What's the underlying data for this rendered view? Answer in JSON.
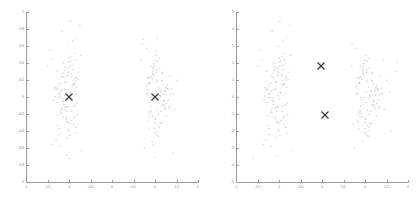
{
  "figure": {
    "background": "#ffffff",
    "point_color": "#a8a8a8",
    "axis_color": "#9a9a9a",
    "centroid_color": "#3a3a3a"
  },
  "chart_data": [
    {
      "type": "scatter",
      "title": "",
      "xlabel": "",
      "ylabel": "",
      "xlim": [
        -2,
        2
      ],
      "ylim": [
        -1,
        1
      ],
      "grid": false,
      "legend": null,
      "xticks": [
        -2,
        -1.5,
        -1,
        -0.5,
        0,
        0.5,
        1,
        1.5,
        2
      ],
      "xticklabels": [
        "-2",
        "-1.5",
        "-1",
        "-0.5",
        "0",
        "0.5",
        "1",
        "1.5",
        "2"
      ],
      "yticks": [
        -1,
        -0.8,
        -0.6,
        -0.4,
        -0.2,
        0,
        0.2,
        0.4,
        0.6,
        0.8,
        1
      ],
      "yticklabels": [
        "-1",
        "-0.8",
        "-0.6",
        "-0.4",
        "-0.2",
        "0",
        "0.2",
        "0.4",
        "0.6",
        "0.8",
        "1"
      ],
      "series": [
        {
          "name": "cluster-a-points",
          "marker": "+",
          "x": [
            -1.02,
            -0.93,
            -1.12,
            -0.86,
            -1.21,
            -0.97,
            -1.05,
            -0.78,
            -1.3,
            -0.9,
            -1.08,
            -1.15,
            -0.82,
            -1.0,
            -1.25,
            -0.95,
            -1.18,
            -0.88,
            -1.07,
            -0.99,
            -1.1,
            -0.84,
            -1.22,
            -1.03,
            -0.91,
            -1.14,
            -0.8,
            -1.28,
            -0.96,
            -1.06,
            -1.19,
            -0.87,
            -1.01,
            -1.24,
            -0.94,
            -1.11,
            -0.83,
            -1.33,
            -0.98,
            -1.09,
            -1.16,
            -0.89,
            -1.04,
            -1.26,
            -0.92,
            -1.13,
            -0.81,
            -1.31,
            -1.0,
            -1.17,
            -0.85,
            -1.23,
            -1.02,
            -0.93,
            -1.2,
            -0.79,
            -1.35,
            -1.08,
            -0.97,
            -1.12,
            -1.27,
            -0.9,
            -1.05,
            -1.14,
            -0.86,
            -1.29,
            -1.01,
            -0.95,
            -1.1,
            -1.21,
            -0.88,
            -1.06,
            -1.17,
            -0.82,
            -1.32,
            -0.99,
            -1.03,
            -1.15,
            -0.91,
            -1.24,
            -1.07,
            -0.94,
            -1.13,
            -0.84,
            -1.26,
            -1.0,
            -1.09,
            -1.18,
            -0.89,
            -1.22,
            -1.04,
            -0.96,
            -1.11,
            -0.87,
            -1.3,
            -1.02,
            -0.92,
            -1.16,
            -1.2,
            -0.85,
            -1.45,
            -0.7,
            -1.4,
            -0.75,
            -1.38,
            -0.72,
            -1.5,
            -1.05,
            -0.98,
            -1.01
          ],
          "y": [
            0.02,
            0.15,
            -0.08,
            0.22,
            -0.18,
            0.05,
            -0.12,
            0.3,
            0.08,
            -0.25,
            0.18,
            -0.05,
            0.12,
            -0.3,
            0.0,
            0.25,
            -0.15,
            -0.22,
            0.1,
            -0.02,
            0.35,
            -0.35,
            0.04,
            -0.1,
            0.2,
            0.28,
            -0.2,
            -0.06,
            0.42,
            -0.28,
            0.07,
            0.16,
            -0.4,
            0.13,
            -0.16,
            0.32,
            0.24,
            0.01,
            -0.45,
            0.19,
            -0.13,
            -0.32,
            0.26,
            0.09,
            0.38,
            -0.24,
            -0.07,
            0.11,
            0.46,
            -0.19,
            0.03,
            -0.36,
            0.29,
            -0.11,
            0.17,
            0.21,
            -0.03,
            -0.26,
            0.06,
            0.4,
            -0.21,
            0.14,
            -0.48,
            0.23,
            -0.09,
            0.31,
            -0.38,
            0.27,
            -0.14,
            0.0,
            0.44,
            -0.17,
            0.08,
            -0.42,
            0.12,
            0.36,
            -0.29,
            -0.01,
            0.33,
            0.05,
            -0.23,
            0.48,
            -0.04,
            0.2,
            -0.33,
            0.41,
            -0.12,
            0.25,
            0.15,
            -0.44,
            0.34,
            -0.27,
            0.1,
            0.52,
            -0.5,
            0.6,
            0.66,
            0.78,
            -0.58,
            0.7,
            0.55,
            -0.62,
            0.45,
            0.85,
            -0.55,
            0.5,
            0.37,
            -0.68,
            0.9,
            -0.72
          ]
        },
        {
          "name": "cluster-b-points",
          "marker": "+",
          "x": [
            0.98,
            1.08,
            0.9,
            1.15,
            0.85,
            1.02,
            1.2,
            0.94,
            1.12,
            0.8,
            1.05,
            0.88,
            1.25,
            1.0,
            0.96,
            1.18,
            0.83,
            1.1,
            1.03,
            0.92,
            1.14,
            0.86,
            1.22,
            0.99,
            1.07,
            0.81,
            1.28,
            0.95,
            1.16,
            1.01,
            0.89,
            1.24,
            0.93,
            1.11,
            0.84,
            1.3,
            0.97,
            1.06,
            1.19,
            0.87,
            1.04,
            1.26,
            0.91,
            1.13,
            0.82,
            1.32,
            1.0,
            1.17,
            0.85,
            1.23,
            1.02,
            0.94,
            1.09,
            0.79,
            1.35,
            1.08,
            0.98,
            1.21,
            0.9,
            1.05,
            1.15,
            0.86,
            1.29,
            1.01,
            0.96,
            1.1,
            1.27,
            0.88,
            1.06,
            1.18,
            0.83,
            1.33,
            0.99,
            1.03,
            1.14,
            0.92,
            1.25,
            1.07,
            0.95,
            1.12,
            0.84,
            1.31,
            1.0,
            1.09,
            1.2,
            0.89,
            1.22,
            1.04,
            0.97,
            1.16,
            0.87,
            1.34,
            1.02,
            0.93,
            1.17,
            1.26,
            0.8,
            1.38,
            0.75,
            1.45,
            0.7,
            1.4,
            1.5,
            0.72,
            1.42,
            0.68,
            1.05,
            0.99,
            1.01,
            0.96
          ],
          "y": [
            0.0,
            0.12,
            -0.1,
            0.2,
            -0.2,
            0.06,
            -0.05,
            0.28,
            -0.3,
            0.15,
            -0.15,
            0.24,
            0.03,
            -0.25,
            0.33,
            -0.08,
            0.1,
            -0.35,
            0.18,
            -0.02,
            0.08,
            -0.18,
            -0.12,
            0.26,
            -0.4,
            0.04,
            0.14,
            -0.22,
            0.3,
            -0.06,
            0.36,
            -0.14,
            0.21,
            0.02,
            -0.28,
            0.09,
            0.4,
            -0.33,
            -0.04,
            0.16,
            -0.45,
            0.11,
            0.23,
            -0.16,
            0.05,
            -0.11,
            0.44,
            0.19,
            -0.38,
            0.07,
            -0.26,
            0.31,
            -0.01,
            0.13,
            0.25,
            -0.2,
            0.38,
            -0.09,
            0.0,
            0.2,
            -0.31,
            0.17,
            0.1,
            -0.42,
            0.27,
            0.34,
            -0.07,
            -0.24,
            0.42,
            0.03,
            0.22,
            -0.13,
            -0.36,
            0.29,
            0.06,
            -0.19,
            0.12,
            -0.46,
            0.35,
            0.01,
            0.24,
            -0.03,
            -0.29,
            0.46,
            0.15,
            -0.17,
            0.08,
            0.32,
            -0.41,
            -0.09,
            0.18,
            0.04,
            0.5,
            -0.52,
            0.28,
            -0.22,
            0.58,
            0.11,
            -0.6,
            -0.14,
            0.62,
            0.05,
            0.2,
            0.68,
            -0.66,
            0.44,
            0.7,
            -0.7,
            0.54,
            -0.57
          ]
        }
      ],
      "centroids": [
        {
          "name": "centroid-a",
          "x": -1.0,
          "y": 0.0,
          "marker": "X"
        },
        {
          "name": "centroid-b",
          "x": 1.0,
          "y": 0.0,
          "marker": "X"
        }
      ]
    },
    {
      "type": "scatter",
      "title": "",
      "xlabel": "",
      "ylabel": "",
      "xlim": [
        -2,
        2
      ],
      "ylim": [
        -5,
        5
      ],
      "grid": false,
      "legend": null,
      "xticks": [
        -2,
        -1.5,
        -1,
        -0.5,
        0,
        0.5,
        1,
        1.5,
        2
      ],
      "xticklabels": [
        "-2",
        "-1.5",
        "-1",
        "-0.5",
        "0",
        "0.5",
        "1",
        "1.5",
        "2"
      ],
      "yticks": [
        -5,
        -4,
        -3,
        -2,
        -1,
        0,
        1,
        2,
        3,
        4,
        5
      ],
      "yticklabels": [
        "-5",
        "-4",
        "-3",
        "-2",
        "-1",
        "0",
        "1",
        "2",
        "3",
        "4",
        "5"
      ],
      "series": [
        {
          "name": "cluster-a-points",
          "marker": "+",
          "x": [
            -1.02,
            -0.93,
            -1.12,
            -0.86,
            -1.21,
            -0.97,
            -1.05,
            -0.78,
            -1.3,
            -0.9,
            -1.08,
            -1.15,
            -0.82,
            -1.0,
            -1.25,
            -0.95,
            -1.18,
            -0.88,
            -1.07,
            -0.99,
            -1.1,
            -0.84,
            -1.22,
            -1.03,
            -0.91,
            -1.14,
            -0.8,
            -1.28,
            -0.96,
            -1.06,
            -1.19,
            -0.87,
            -1.01,
            -1.24,
            -0.94,
            -1.11,
            -0.83,
            -1.33,
            -0.98,
            -1.09,
            -1.16,
            -0.89,
            -1.04,
            -1.26,
            -0.92,
            -1.13,
            -0.81,
            -1.31,
            -1.0,
            -1.17,
            -0.85,
            -1.23,
            -1.02,
            -0.93,
            -1.2,
            -0.79,
            -1.35,
            -1.08,
            -0.97,
            -1.12,
            -1.27,
            -0.9,
            -1.05,
            -1.14,
            -0.86,
            -1.29,
            -1.01,
            -0.95,
            -1.1,
            -1.21,
            -0.88,
            -1.06,
            -1.17,
            -0.82,
            -1.32,
            -0.99,
            -1.03,
            -1.15,
            -0.91,
            -1.24,
            -1.07,
            -0.94,
            -1.13,
            -0.84,
            -1.26,
            -1.0,
            -1.09,
            -1.18,
            -0.89,
            -1.22,
            -1.04,
            -0.96,
            -1.11,
            -0.87,
            -1.3,
            -1.02,
            -0.92,
            -1.16,
            -1.2,
            -0.85,
            -1.45,
            -0.7,
            -1.4,
            -0.75,
            -1.38,
            -0.72,
            -1.5,
            -1.05,
            -0.98,
            -1.6
          ],
          "y": [
            0.1,
            0.75,
            -0.4,
            1.1,
            -0.9,
            0.25,
            -0.6,
            1.5,
            0.4,
            -1.25,
            0.9,
            -0.25,
            0.6,
            -1.5,
            0.0,
            1.25,
            -0.75,
            -1.1,
            0.5,
            -0.1,
            1.75,
            -1.75,
            0.2,
            -0.5,
            1.0,
            1.4,
            -1.0,
            -0.3,
            2.1,
            -1.4,
            0.35,
            0.8,
            -2.0,
            0.65,
            -0.8,
            1.6,
            1.2,
            0.05,
            -2.25,
            0.95,
            -0.65,
            -1.6,
            1.3,
            0.45,
            1.9,
            -1.2,
            -0.35,
            0.55,
            2.3,
            -0.95,
            0.15,
            -1.8,
            1.45,
            -0.55,
            0.85,
            1.05,
            -0.15,
            -1.3,
            0.3,
            2.0,
            -1.05,
            0.7,
            -2.4,
            1.15,
            -0.45,
            1.55,
            -1.9,
            1.35,
            -0.7,
            0.0,
            2.2,
            -0.85,
            0.4,
            -2.1,
            0.6,
            1.8,
            -1.45,
            -0.05,
            1.65,
            0.25,
            -1.15,
            2.4,
            -0.2,
            1.0,
            -1.65,
            2.05,
            -0.6,
            1.25,
            0.75,
            -2.2,
            1.7,
            -1.35,
            0.5,
            2.6,
            -2.5,
            3.0,
            3.3,
            3.9,
            -2.9,
            3.5,
            2.75,
            -3.1,
            2.25,
            4.25,
            -2.75,
            2.5,
            1.85,
            -3.4,
            4.5,
            -3.6
          ]
        },
        {
          "name": "cluster-b-points",
          "marker": "+",
          "x": [
            0.98,
            1.08,
            0.9,
            1.15,
            0.85,
            1.02,
            1.2,
            0.94,
            1.12,
            0.8,
            1.05,
            0.88,
            1.25,
            1.0,
            0.96,
            1.18,
            0.83,
            1.1,
            1.03,
            0.92,
            1.14,
            0.86,
            1.22,
            0.99,
            1.07,
            0.81,
            1.28,
            0.95,
            1.16,
            1.01,
            0.89,
            1.24,
            0.93,
            1.11,
            0.84,
            1.3,
            0.97,
            1.06,
            1.19,
            0.87,
            1.04,
            1.26,
            0.91,
            1.13,
            0.82,
            1.32,
            1.0,
            1.17,
            0.85,
            1.23,
            1.02,
            0.94,
            1.09,
            0.79,
            1.35,
            1.08,
            0.98,
            1.21,
            0.9,
            1.05,
            1.15,
            0.86,
            1.29,
            1.01,
            0.96,
            1.1,
            1.27,
            0.88,
            1.06,
            1.18,
            0.83,
            1.33,
            0.99,
            1.03,
            1.14,
            0.92,
            1.25,
            1.07,
            0.95,
            1.12,
            0.84,
            1.31,
            1.0,
            1.09,
            1.2,
            0.89,
            1.22,
            1.04,
            0.97,
            1.16,
            0.87,
            1.34,
            1.02,
            0.93,
            1.17,
            1.26,
            0.8,
            1.38,
            0.75,
            1.45,
            0.7,
            1.4,
            1.5,
            0.72,
            1.42,
            0.68,
            1.55,
            1.6,
            1.72,
            1.75
          ],
          "y": [
            0.0,
            0.6,
            -0.5,
            1.0,
            -1.0,
            0.3,
            -0.25,
            1.4,
            -1.5,
            0.75,
            -0.75,
            1.2,
            0.15,
            -1.25,
            1.65,
            -0.4,
            0.5,
            -1.75,
            0.9,
            -0.1,
            0.4,
            -0.9,
            -0.6,
            1.3,
            -2.0,
            0.2,
            0.7,
            -1.1,
            1.5,
            -0.3,
            1.8,
            -0.7,
            1.05,
            0.1,
            -1.4,
            0.45,
            2.0,
            -1.65,
            -0.2,
            0.8,
            -2.25,
            0.55,
            1.15,
            -0.8,
            0.25,
            -0.55,
            2.2,
            0.95,
            -1.9,
            0.35,
            -1.3,
            1.55,
            -0.05,
            0.65,
            1.25,
            -1.0,
            1.9,
            -0.45,
            0.0,
            1.0,
            -1.55,
            0.85,
            0.5,
            -2.1,
            1.35,
            1.7,
            -0.35,
            -1.2,
            2.1,
            0.15,
            1.1,
            -0.65,
            -1.8,
            1.45,
            0.3,
            -0.95,
            0.6,
            -2.3,
            1.75,
            0.05,
            1.2,
            -0.15,
            -1.45,
            2.3,
            0.75,
            -0.85,
            0.4,
            1.6,
            -2.05,
            -0.45,
            0.9,
            0.2,
            2.5,
            -2.6,
            1.4,
            -1.1,
            2.9,
            0.55,
            -3.0,
            -0.7,
            3.1,
            0.25,
            1.0,
            -1.6,
            2.2,
            1.85,
            0.3,
            -2.0,
            1.55,
            2.05
          ]
        }
      ],
      "centroids": [
        {
          "name": "centroid-a",
          "x": -0.02,
          "y": 1.8,
          "marker": "X"
        },
        {
          "name": "centroid-b",
          "x": 0.06,
          "y": -1.05,
          "marker": "X"
        }
      ]
    }
  ]
}
